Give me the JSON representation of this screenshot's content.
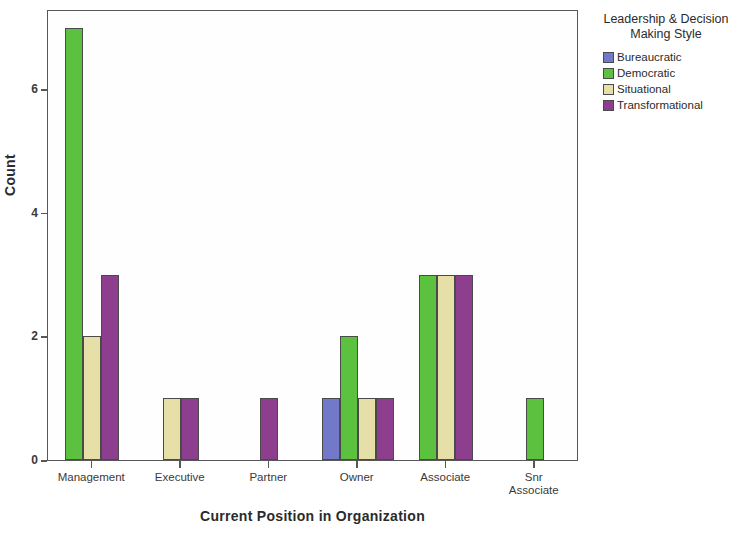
{
  "chart_data": {
    "type": "bar",
    "title": "",
    "subtitle": "",
    "xlabel": "Current Position in Organization",
    "ylabel": "Count",
    "categories": [
      "Management",
      "Executive",
      "Partner",
      "Owner",
      "Associate",
      "Snr Associate"
    ],
    "category_labels_display": [
      "Management",
      "Executive",
      "Partner",
      "Owner",
      "Associate",
      "Snr\nAssociate"
    ],
    "series": [
      {
        "name": "Bureaucratic",
        "color": "#7179c8",
        "values": [
          0,
          0,
          0,
          1,
          0,
          0
        ]
      },
      {
        "name": "Democratic",
        "color": "#5cc13f",
        "values": [
          7,
          0,
          0,
          2,
          3,
          1
        ]
      },
      {
        "name": "Situational",
        "color": "#e6e0a8",
        "values": [
          2,
          1,
          0,
          1,
          3,
          0
        ]
      },
      {
        "name": "Transformational",
        "color": "#8e3e8e",
        "values": [
          3,
          1,
          1,
          1,
          3,
          0
        ]
      }
    ],
    "ylim": [
      0,
      7.3
    ],
    "yticks": [
      0,
      2,
      4,
      6
    ],
    "ytick_labels": [
      "0",
      "2",
      "4",
      "6"
    ],
    "grid": false,
    "legend_position": "right",
    "legend_title": "Leadership & Decision\nMaking Style"
  },
  "axes": {
    "y_title": "Count",
    "x_title": "Current Position in Organization"
  },
  "legend": {
    "title": "Leadership & Decision\nMaking Style",
    "items": [
      {
        "label": "Bureaucratic",
        "color": "#7179c8"
      },
      {
        "label": "Democratic",
        "color": "#5cc13f"
      },
      {
        "label": "Situational",
        "color": "#e6e0a8"
      },
      {
        "label": "Transformational",
        "color": "#8e3e8e"
      }
    ]
  }
}
